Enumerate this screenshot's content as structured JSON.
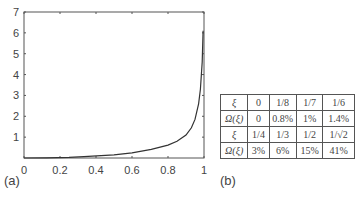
{
  "chart_data": [
    {
      "type": "line",
      "panel": "(a)",
      "title": "",
      "xlabel": "",
      "ylabel": "",
      "xlim": [
        0,
        1
      ],
      "ylim": [
        0,
        7
      ],
      "xticks": [
        "0",
        "0.2",
        "0.4",
        "0.6",
        "0.8",
        "1"
      ],
      "yticks": [
        "1",
        "2",
        "3",
        "4",
        "5",
        "6",
        "7"
      ],
      "grid": false,
      "series": [
        {
          "name": "Omega(xi)",
          "x": [
            0,
            0.125,
            0.25,
            0.333,
            0.5,
            0.6,
            0.707,
            0.8,
            0.85,
            0.9,
            0.93,
            0.95,
            0.97,
            0.98,
            0.99,
            0.995
          ],
          "y": [
            0,
            0.008,
            0.03,
            0.06,
            0.15,
            0.25,
            0.41,
            0.62,
            0.8,
            1.1,
            1.45,
            1.85,
            2.6,
            3.3,
            4.6,
            6.1
          ]
        }
      ]
    },
    {
      "type": "table",
      "panel": "(b)",
      "rows": [
        [
          "ξ",
          "0",
          "1/8",
          "1/7",
          "1/6"
        ],
        [
          "Ω(ξ)",
          "0",
          "0.8%",
          "1%",
          "1.4%"
        ],
        [
          "ξ",
          "1/4",
          "1/3",
          "1/2",
          "1/√2"
        ],
        [
          "Ω(ξ)",
          "3%",
          "6%",
          "15%",
          "41%"
        ]
      ]
    }
  ],
  "labels": {
    "panel_a": "(a)",
    "panel_b": "(b)"
  },
  "colors": {
    "axis": "#555555",
    "curve": "#333333",
    "text": "#444444"
  }
}
